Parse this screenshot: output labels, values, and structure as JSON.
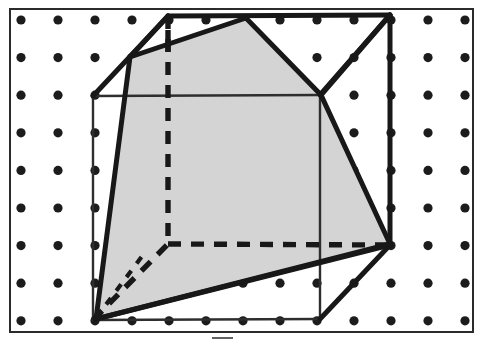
{
  "figure": {
    "type": "geometry-diagram",
    "canvas": {
      "width": 483,
      "height": 341,
      "background": "#ffffff"
    },
    "frame": {
      "name": "border-rectangle",
      "x": 10,
      "y": 9,
      "width": 463,
      "height": 323,
      "stroke": "#2b2b2b",
      "stroke_width": 2,
      "fill": "#ffffff"
    },
    "tick_mark": {
      "name": "bottom-tick",
      "x1": 212,
      "y1": 338,
      "x2": 233,
      "y2": 338,
      "stroke": "#3a3a3a",
      "stroke_width": 1.6
    },
    "dot_grid": {
      "name": "lattice-dots",
      "origin_x": 21,
      "origin_y": 20,
      "spacing_x": 37,
      "spacing_y": 37.6,
      "columns": 13,
      "rows": 9,
      "radius": 4.6,
      "color": "#1c1c1c"
    },
    "colors": {
      "ink": "#181818",
      "shade_fill": "#d4d4d4",
      "paper": "#ffffff",
      "thin_ink": "#2e2e2e"
    },
    "stroke_widths": {
      "cube_solid": 5.0,
      "cube_thin": 2.4,
      "cut_polygon": 5.0,
      "hidden_dash": 5.4
    },
    "dash_pattern": "13 10",
    "cube": {
      "name": "cube-wireframe",
      "vertices": {
        "front_top_left": {
          "x": 93,
          "y": 96
        },
        "front_top_right": {
          "x": 320,
          "y": 95
        },
        "front_bottom_left": {
          "x": 93,
          "y": 320
        },
        "front_bottom_right": {
          "x": 320,
          "y": 319
        },
        "back_top_left": {
          "x": 168,
          "y": 16
        },
        "back_top_right": {
          "x": 390,
          "y": 15
        },
        "back_bottom_left": {
          "x": 168,
          "y": 244
        },
        "back_bottom_right": {
          "x": 390,
          "y": 245
        }
      },
      "visible_edges": [
        {
          "name": "edge-back-top",
          "from": "back_top_left",
          "to": "back_top_right",
          "style": "solid-heavy"
        },
        {
          "name": "edge-back-right-vertical",
          "from": "back_top_right",
          "to": "back_bottom_right",
          "style": "solid-heavy"
        },
        {
          "name": "edge-front-top-right-to-back-top-right",
          "from": "front_top_right",
          "to": "back_top_right",
          "style": "solid-heavy"
        },
        {
          "name": "edge-front-bottom-right-to-back-bottom-right",
          "from": "front_bottom_right",
          "to": "back_bottom_right",
          "style": "solid-heavy"
        },
        {
          "name": "edge-front-left-vertical",
          "from": "front_top_left",
          "to": "front_bottom_left",
          "style": "solid-thin"
        },
        {
          "name": "edge-front-top",
          "from": "front_top_left",
          "to": "front_top_right",
          "style": "solid-thin"
        },
        {
          "name": "edge-front-right-vertical",
          "from": "front_top_right",
          "to": "front_bottom_right",
          "style": "solid-thin"
        },
        {
          "name": "edge-front-bottom",
          "from": "front_bottom_left",
          "to": "front_bottom_right",
          "style": "solid-thin"
        },
        {
          "name": "edge-front-top-left-to-back-top-left",
          "from": "front_top_left",
          "to": "back_top_left",
          "style": "solid-heavy"
        }
      ],
      "hidden_edges": [
        {
          "name": "hidden-edge-back-left-vertical",
          "from": "back_top_left",
          "to": "back_bottom_left",
          "style": "dashed"
        },
        {
          "name": "hidden-edge-back-bottom",
          "from": "back_bottom_left",
          "to": "back_bottom_right",
          "style": "dashed"
        },
        {
          "name": "hidden-edge-front-bottom-left-to-back-bottom-left",
          "from": "front_bottom_left",
          "to": "back_bottom_left",
          "style": "dashed"
        }
      ]
    },
    "cut_polygon": {
      "name": "cross-section-polygon",
      "fill": "#d4d4d4",
      "stroke": "#181818",
      "stroke_width": 5.0,
      "points": [
        {
          "x": 130,
          "y": 57
        },
        {
          "x": 246,
          "y": 18
        },
        {
          "x": 321,
          "y": 95
        },
        {
          "x": 390,
          "y": 244
        },
        {
          "x": 96,
          "y": 319
        }
      ]
    },
    "overlay_edges": [
      {
        "name": "overlay-edge-cut-to-back-top-left",
        "x1": 130,
        "y1": 57,
        "x2": 168,
        "y2": 16,
        "style": "solid-heavy"
      },
      {
        "name": "overlay-edge-back-top-right-to-front-top-right",
        "x1": 390,
        "y1": 15,
        "x2": 321,
        "y2": 95,
        "style": "solid-heavy"
      },
      {
        "name": "overlay-edge-back-bottom-right-to-front-bottom-left",
        "x1": 390,
        "y1": 245,
        "x2": 96,
        "y2": 319,
        "style": "solid-heavy"
      },
      {
        "name": "overlay-stub-vertical-top",
        "x1": 168,
        "y1": 30,
        "x2": 168,
        "y2": 52,
        "style": "dashed-stub"
      }
    ],
    "hidden_diagonal": {
      "name": "hidden-diagonal-in-section",
      "x1": 96,
      "y1": 318,
      "x2": 143,
      "y2": 255,
      "style": "dashed-fine"
    }
  }
}
